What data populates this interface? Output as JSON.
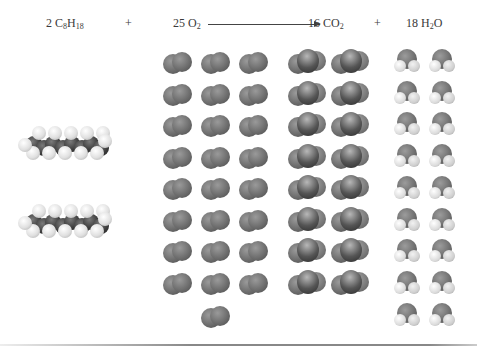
{
  "equation": {
    "reactant1": {
      "coef": "2",
      "formula_parts": [
        "C",
        "8",
        "H",
        "18"
      ]
    },
    "plus1": "+",
    "reactant2": {
      "coef": "25",
      "formula_parts": [
        "O",
        "2"
      ]
    },
    "arrow": "→",
    "product1": {
      "coef": "16",
      "formula_parts": [
        "CO",
        "2"
      ]
    },
    "plus2": "+",
    "product2": {
      "coef": "18",
      "formula_parts": [
        "H",
        "2",
        "O"
      ]
    }
  },
  "molecule_counts": {
    "octane": 2,
    "oxygen": 25,
    "carbon_dioxide": 16,
    "water": 18
  },
  "layout": {
    "oxygen": {
      "columns": 3,
      "rows": 8,
      "extra": 1
    },
    "carbon_dioxide": {
      "columns": 2,
      "rows": 8
    },
    "water": {
      "columns": 2,
      "rows": 9
    }
  },
  "colors": {
    "oxygen_atom": "#6e6e6e",
    "carbon_atom": "#3a3a3a",
    "hydrogen_atom": "#e0e0e0",
    "text": "#3a3a3a"
  }
}
